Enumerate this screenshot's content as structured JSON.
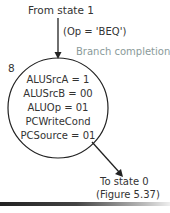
{
  "diagram": {
    "incoming": {
      "source_label": "From state 1",
      "condition": "(Op = 'BEQ')"
    },
    "state": {
      "number": "8",
      "phase_label": "Branch completion",
      "signals": [
        "ALUSrcA = 1",
        "ALUSrcB = 00",
        "ALUOp = 01",
        "PCWriteCond",
        "PCSource = 01"
      ]
    },
    "outgoing": {
      "target_label": "To state 0",
      "reference": "(Figure 5.37)"
    },
    "colors": {
      "stroke": "#222222",
      "text": "#333333",
      "phase_label": "#8a9a9a"
    }
  }
}
